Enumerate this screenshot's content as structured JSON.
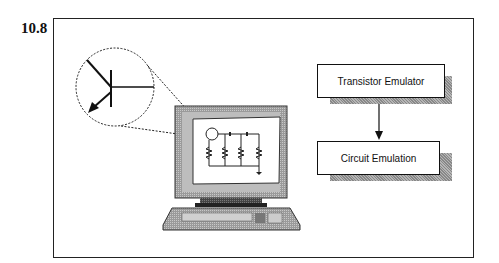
{
  "figure": {
    "number": "10.8"
  },
  "flowchart": {
    "boxes": [
      {
        "label": "Transistor Emulator"
      },
      {
        "label": "Circuit Emulation"
      }
    ],
    "arrow": "Transistor Emulator → Circuit Emulation"
  },
  "illustration": {
    "magnifier": "transistor-symbol",
    "computer_screen": "resistor-circuit"
  }
}
